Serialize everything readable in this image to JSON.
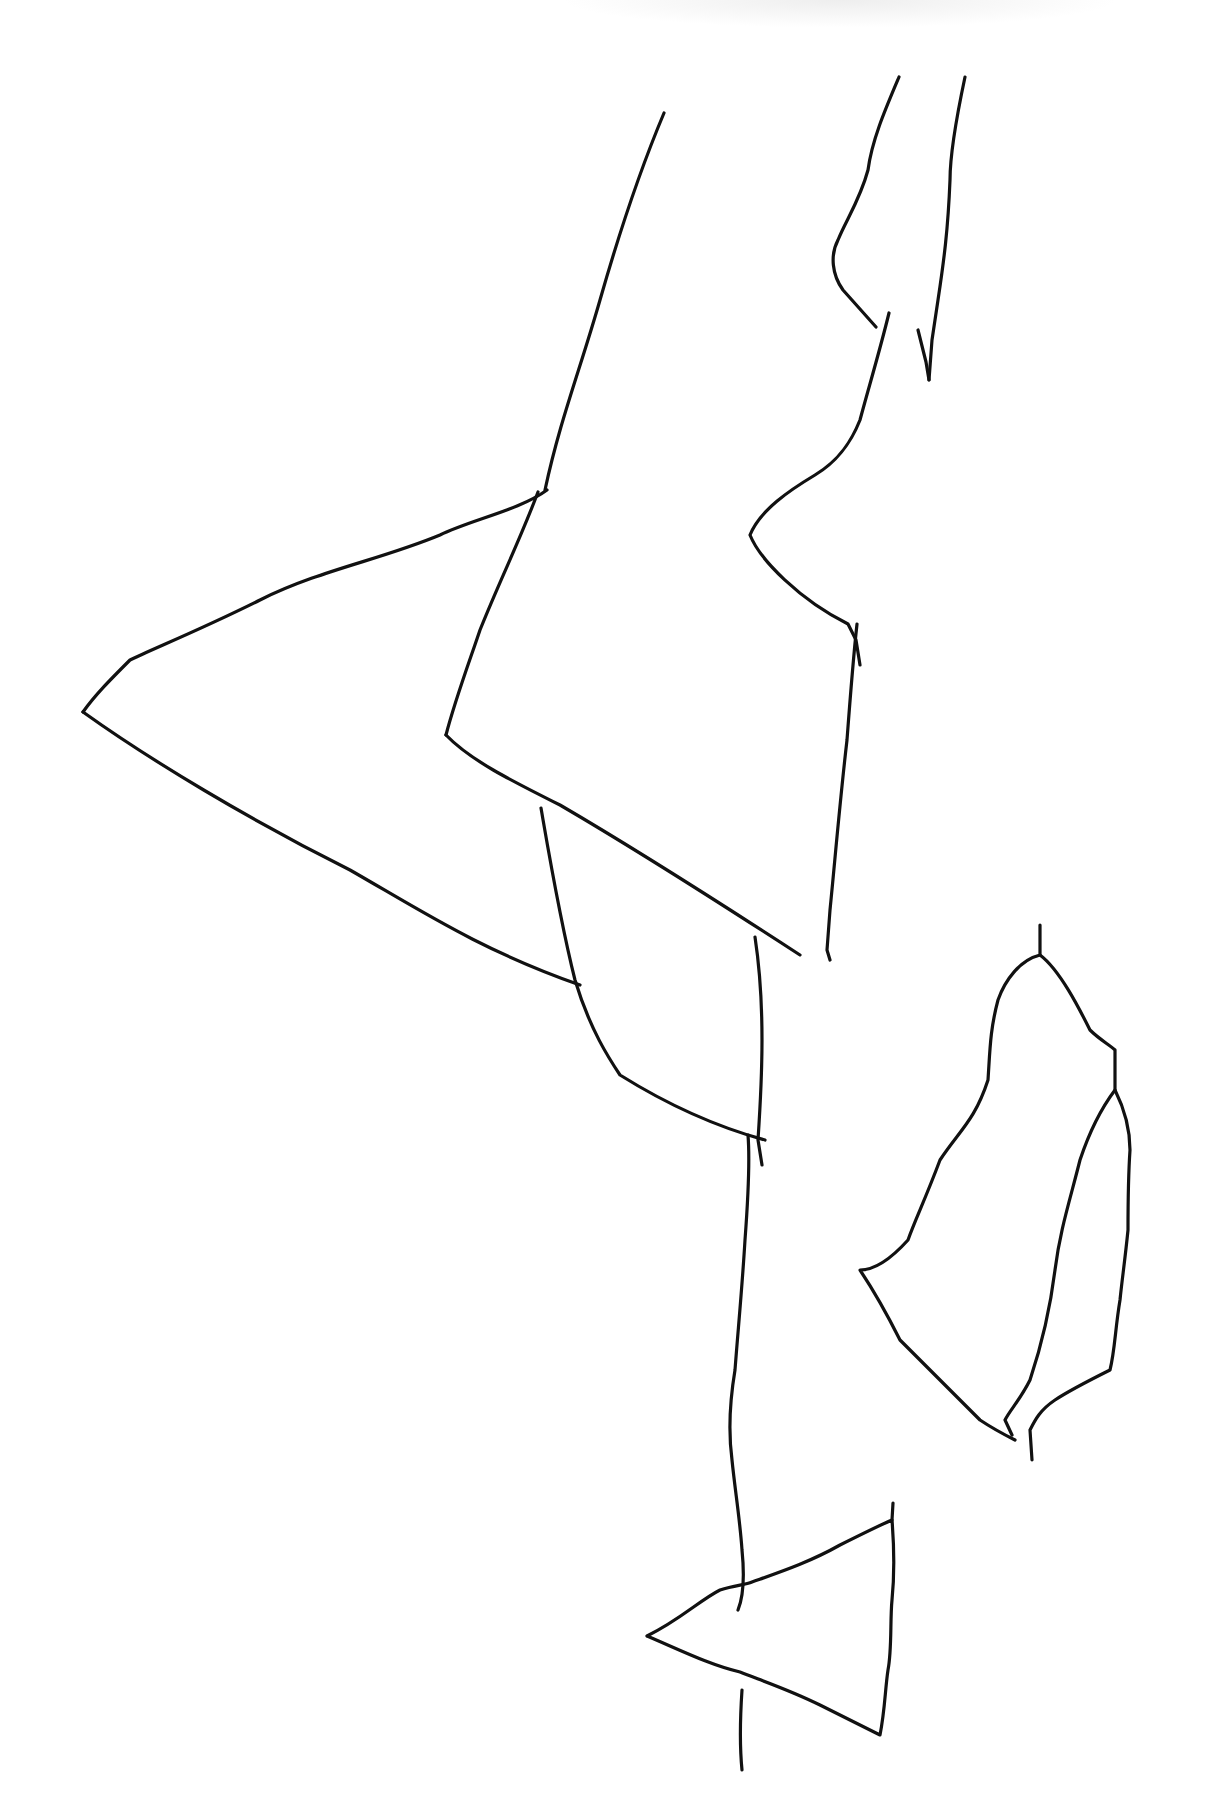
{
  "image": {
    "width": 1213,
    "height": 1807,
    "background": "#ffffff",
    "stroke_color": "#111111",
    "description": "Hand-drawn black line sketch of abstract angular shapes"
  },
  "strokes": [
    {
      "name": "left-long-edge",
      "d": "M 664 113 C 640 170 620 230 600 300 C 580 370 560 420 545 490"
    },
    {
      "name": "upper-right-left-edge",
      "d": "M 899 77 C 885 110 872 140 868 170 C 860 200 846 220 838 240 C 830 255 832 275 843 290 L 876 327"
    },
    {
      "name": "upper-right-right-edge",
      "d": "M 965 77 C 958 110 950 150 950 180 C 948 230 944 260 938 300 L 932 340 L 929 380"
    },
    {
      "name": "mid-right-notch",
      "d": "M 889 313 C 880 350 868 390 860 420 C 852 440 840 460 815 475 C 790 490 760 510 750 535 C 760 560 800 600 848 624 L 856 640 L 860 665"
    },
    {
      "name": "upper-branch-to-notch",
      "d": "M 929 380 L 926 362 L 918 330"
    },
    {
      "name": "mid-vertical-right",
      "d": "M 857 624 C 853 660 850 700 847 740 C 840 800 835 860 830 910 L 827 950 L 830 960"
    },
    {
      "name": "big-wedge-top",
      "d": "M 547 490 C 520 510 470 520 440 535 C 380 560 320 570 260 600 C 200 630 150 650 130 660 C 110 680 95 695 83 712"
    },
    {
      "name": "big-wedge-bottom",
      "d": "M 83 712 C 150 760 250 820 350 870 C 420 910 480 950 580 985"
    },
    {
      "name": "wedge-inner-edge",
      "d": "M 538 492 C 520 540 500 580 480 630 C 470 660 455 700 446 735"
    },
    {
      "name": "central-parallelogram-bottom",
      "d": "M 446 735 C 470 760 510 780 560 805 C 620 840 700 890 800 955"
    },
    {
      "name": "lower-flap-left",
      "d": "M 541 808 C 550 860 560 920 575 980 C 590 1030 610 1060 620 1075 C 660 1100 710 1125 765 1140"
    },
    {
      "name": "lower-flap-right",
      "d": "M 755 937 C 760 970 762 1000 762 1040 C 762 1080 760 1110 758 1140 L 762 1165"
    },
    {
      "name": "trunk-left",
      "d": "M 748 1135 C 750 1160 748 1200 745 1240 C 742 1290 738 1330 735 1370 C 730 1400 728 1430 732 1460 C 735 1490 740 1520 742 1550 C 745 1580 742 1600 738 1610"
    },
    {
      "name": "trunk-bottom-stub",
      "d": "M 742 1690 C 740 1720 740 1750 742 1770"
    },
    {
      "name": "leaf-outer",
      "d": "M 1040 925 L 1040 955 C 1020 960 1005 980 998 1000 C 990 1030 990 1050 988 1080 C 975 1120 960 1130 940 1160 C 925 1200 915 1220 908 1240 C 890 1260 875 1270 860 1270 C 880 1300 890 1320 900 1340 C 930 1370 960 1400 980 1420 C 995 1430 1005 1435 1015 1440"
    },
    {
      "name": "leaf-right-edge",
      "d": "M 1040 955 C 1060 970 1080 1010 1090 1030 C 1100 1040 1110 1045 1115 1050 L 1115 1090 C 1125 1110 1130 1130 1130 1150 C 1128 1180 1128 1200 1128 1230 C 1125 1260 1122 1280 1120 1300 C 1115 1330 1115 1350 1110 1370 C 1090 1380 1070 1390 1055 1400 C 1040 1410 1035 1420 1030 1430 L 1032 1460"
    },
    {
      "name": "leaf-midrib",
      "d": "M 1115 1090 C 1100 1110 1090 1130 1080 1160 C 1070 1200 1060 1230 1055 1270 C 1050 1310 1040 1350 1030 1380 C 1020 1400 1010 1410 1005 1420 L 1012 1435"
    },
    {
      "name": "bottom-triangle",
      "d": "M 647 1636 C 680 1620 700 1600 720 1590 C 735 1585 745 1585 752 1582 C 780 1572 810 1562 840 1545 C 860 1535 880 1525 892 1520 C 894 1545 895 1570 892 1600 C 890 1620 892 1650 888 1670 C 885 1690 885 1710 880 1735 C 860 1725 840 1715 820 1705 C 790 1690 760 1680 740 1672 C 710 1665 680 1650 647 1636"
    },
    {
      "name": "bottom-triangle-top-stub",
      "d": "M 892 1520 L 893 1503"
    }
  ]
}
